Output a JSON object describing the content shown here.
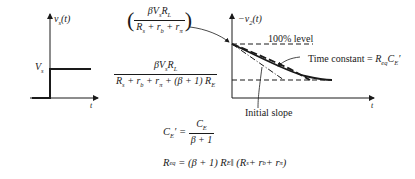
{
  "input_plot": {
    "y_label": "v_s(t)",
    "x_label": "t",
    "step_level_label": "V_s"
  },
  "output_plot": {
    "y_label": "−v_2(t)",
    "x_label": "t",
    "level_100_label": "100% level",
    "time_constant_label": "Time constant = R_eq C_E'",
    "initial_slope_label": "Initial slope"
  },
  "formulas": {
    "initial_value": {
      "numerator": "βV_s R_L",
      "denominator": "R_s + r_b + r_π"
    },
    "final_value": {
      "numerator": "βV_s R_L",
      "denominator": "R_s + r_b + r_π + (β+1) R_E"
    },
    "ce_prime": "C_E' = C_E / (β+1)",
    "req": "R_eq = (β+1) R_E ‖ (R_s + r_b + r_π)"
  },
  "colors": {
    "ink": "#1a1a1a",
    "background": "#ffffff"
  }
}
